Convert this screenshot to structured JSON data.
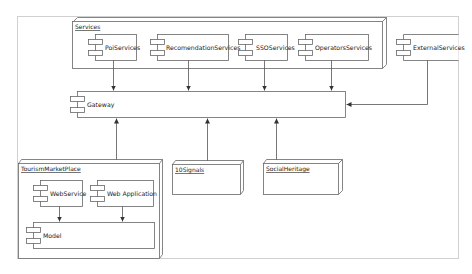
{
  "diagram": {
    "type": "UML deployment / component diagram",
    "nodes": [
      {
        "id": "services",
        "label": "Services",
        "kind": "node",
        "components": [
          "PoiServices",
          "RecomendationServices",
          "SSOServices",
          "OperatorsServices"
        ]
      },
      {
        "id": "tourism",
        "label": "TourismMarketPlace",
        "kind": "node",
        "components": [
          "WebService",
          "Web Application",
          "Model"
        ]
      },
      {
        "id": "tensignals",
        "label": "10Signals",
        "kind": "node",
        "components": []
      },
      {
        "id": "socialheritage",
        "label": "SocialHeritage",
        "kind": "node",
        "components": []
      }
    ],
    "components": {
      "poi": "PoiServices",
      "recomendation": "RecomendationServices",
      "sso": "SSOServices",
      "operators": "OperatorsServices",
      "external": "ExternalServices",
      "gateway": "Gateway",
      "webservice": "WebService",
      "webapp": "Web Application",
      "model": "Model"
    },
    "edges": [
      {
        "from": "PoiServices",
        "to": "Gateway"
      },
      {
        "from": "RecomendationServices",
        "to": "Gateway"
      },
      {
        "from": "SSOServices",
        "to": "Gateway"
      },
      {
        "from": "OperatorsServices",
        "to": "Gateway"
      },
      {
        "from": "ExternalServices",
        "to": "Gateway"
      },
      {
        "from": "TourismMarketPlace",
        "to": "Gateway"
      },
      {
        "from": "10Signals",
        "to": "Gateway"
      },
      {
        "from": "SocialHeritage",
        "to": "Gateway"
      },
      {
        "from": "WebService",
        "to": "Model"
      },
      {
        "from": "Web Application",
        "to": "Model"
      }
    ],
    "colors": {
      "line": "#555555",
      "frame": "#cccccc",
      "background": "#ffffff"
    }
  }
}
